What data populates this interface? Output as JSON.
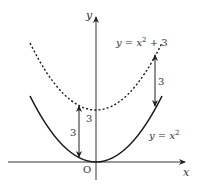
{
  "diagram": {
    "type": "graph-transformation",
    "axes": {
      "x_label": "x",
      "y_label": "y",
      "origin_label": "O"
    },
    "curves": [
      {
        "name": "base-parabola",
        "equation_lhs": "y = x",
        "exponent": "2",
        "equation_rhs": "",
        "style": "solid",
        "color": "#1a1a1a"
      },
      {
        "name": "shifted-parabola",
        "equation_lhs": "y = x",
        "exponent": "2",
        "equation_rhs": " + 3",
        "style": "dotted",
        "color": "#1a1a1a"
      }
    ],
    "shift": {
      "left_arrow_label": "3",
      "right_arrow_label": "3",
      "intercept_label": "3"
    },
    "colors": {
      "axis": "#333333",
      "curve": "#1a1a1a",
      "background": "#ffffff"
    }
  }
}
